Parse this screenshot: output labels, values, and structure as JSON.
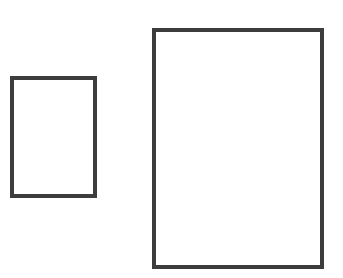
{
  "diagram": {
    "stroke_color": "#3d3d3d",
    "fill_color": "#ffffff",
    "background_color": "#ffffff",
    "shapes": [
      {
        "id": "small-rectangle",
        "label": ""
      },
      {
        "id": "large-rectangle",
        "label": ""
      }
    ]
  }
}
